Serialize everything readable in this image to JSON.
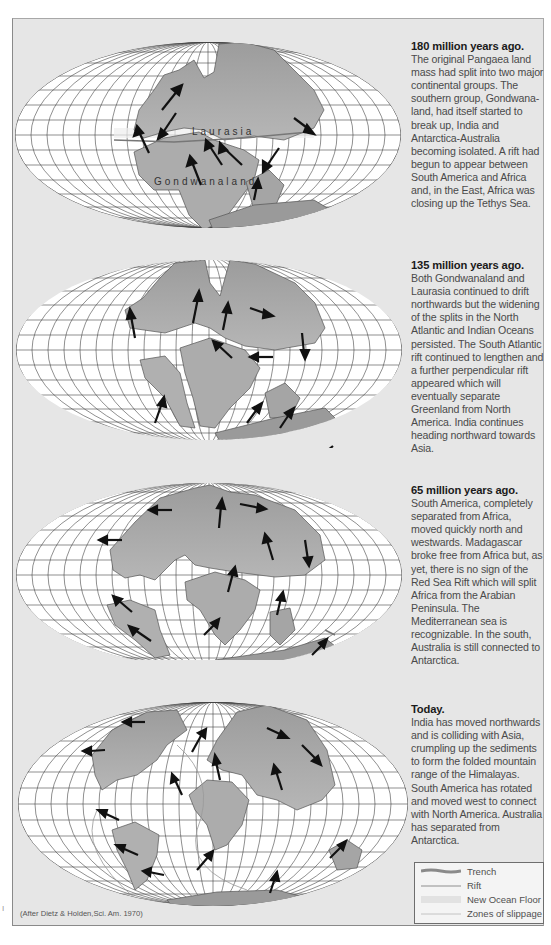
{
  "figure": {
    "credit": "(After Dietz & Holden,Sci. Am. 1970)",
    "side_mark": "I"
  },
  "panels": [
    {
      "title": "180 million years ago.",
      "body": "The original Pangaea land mass had split into two major continental groups. The southern group, Gondwana-land, had itself started to break up, India and Antarctica-Australia becoming isolated. A rift had begun to appear between South America and Africa and, in the East, Africa was closing up the Tethys Sea.",
      "map_labels": [
        "Laurasia",
        "Gondwanaland"
      ]
    },
    {
      "title": "135 million years ago.",
      "body": "Both Gondwanaland and Laurasia continued to drift northwards but the widening of the splits in the North Atlantic and Indian Oceans persisted. The South Atlantic rift continued to lengthen and a further perpendicular rift appeared which will eventually separate Greenland from North America. India continues heading northward towards Asia."
    },
    {
      "title": "65 million years ago.",
      "body": "South America, completely separated from Africa, moved quickly north and westwards. Madagascar broke free from Africa but, as yet, there is no sign of the Red Sea Rift which will split Africa from the Arabian Peninsula. The Mediterranean sea is recognizable. In the south, Australia is still connected to Antarctica."
    },
    {
      "title": "Today.",
      "body": "India has moved northwards and is colliding with Asia, crumpling up the sediments to form the folded mountain range of the Himalayas. South America has rotated and moved west to connect with North America. Australia has separated from Antarctica."
    }
  ],
  "legend": {
    "items": [
      {
        "label": "Trench",
        "style": "trench"
      },
      {
        "label": "Rift",
        "style": "rift"
      },
      {
        "label": "New Ocean Floor",
        "style": "ocean-floor"
      },
      {
        "label": "Zones of slippage",
        "style": "slippage"
      }
    ]
  },
  "colors": {
    "panel_bg": "#e6e6e6",
    "ocean": "#ffffff",
    "land": "#a9a9a9",
    "grid": "#333333",
    "arrow": "#111111"
  }
}
